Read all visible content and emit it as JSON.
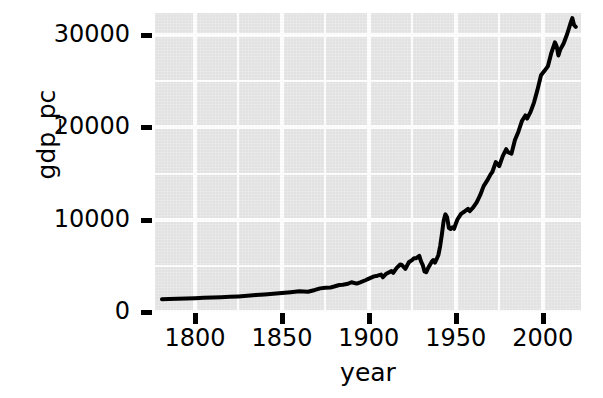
{
  "chart_data": {
    "type": "line",
    "title": "",
    "subtitle": "",
    "xlabel": "year",
    "ylabel": "gdp_pc",
    "xlim": [
      1777,
      2022
    ],
    "ylim": [
      0,
      32400
    ],
    "grid": true,
    "legend": null,
    "x_ticks": [
      1800,
      1850,
      1900,
      1950,
      2000
    ],
    "x_tick_labels": [
      "1800",
      "1850",
      "1900",
      "1950",
      "2000"
    ],
    "x_minor_ticks": [
      1775,
      1825,
      1875,
      1925,
      1975,
      2025
    ],
    "y_ticks": [
      0,
      10000,
      20000,
      30000
    ],
    "y_tick_labels": [
      "0",
      "10000",
      "20000",
      "30000"
    ],
    "y_minor_ticks": [
      5000,
      15000,
      25000
    ],
    "series": [
      {
        "name": "gdp_pc",
        "color": "#000000",
        "line_width": 4,
        "x": [
          1781,
          1785,
          1790,
          1795,
          1800,
          1805,
          1810,
          1815,
          1820,
          1825,
          1830,
          1835,
          1840,
          1845,
          1850,
          1855,
          1860,
          1865,
          1869,
          1872,
          1875,
          1878,
          1880,
          1883,
          1885,
          1888,
          1890,
          1893,
          1895,
          1898,
          1900,
          1903,
          1905,
          1907,
          1908,
          1910,
          1913,
          1914,
          1916,
          1918,
          1919,
          1920,
          1921,
          1923,
          1925,
          1926,
          1927,
          1929,
          1930,
          1931,
          1932,
          1933,
          1934,
          1936,
          1937,
          1938,
          1939,
          1940,
          1941,
          1942,
          1943,
          1944,
          1945,
          1946,
          1947,
          1948,
          1949,
          1950,
          1951,
          1953,
          1955,
          1957,
          1958,
          1960,
          1962,
          1964,
          1966,
          1968,
          1970,
          1971,
          1973,
          1974,
          1975,
          1977,
          1979,
          1980,
          1982,
          1984,
          1986,
          1988,
          1990,
          1991,
          1993,
          1995,
          1997,
          1999,
          2001,
          2003,
          2005,
          2007,
          2008,
          2009,
          2010,
          2012,
          2014,
          2016,
          2017,
          2018,
          2019
        ],
        "y": [
          1380,
          1400,
          1430,
          1460,
          1500,
          1540,
          1580,
          1600,
          1640,
          1690,
          1760,
          1830,
          1900,
          1970,
          2060,
          2150,
          2260,
          2200,
          2390,
          2560,
          2620,
          2660,
          2760,
          2930,
          2960,
          3060,
          3220,
          3080,
          3210,
          3440,
          3620,
          3860,
          3930,
          4060,
          3760,
          4150,
          4430,
          4250,
          4780,
          5140,
          5100,
          4880,
          4680,
          5390,
          5640,
          5830,
          5820,
          6070,
          5490,
          5090,
          4400,
          4310,
          4740,
          5400,
          5620,
          5350,
          5750,
          6180,
          7150,
          8420,
          9890,
          10580,
          10270,
          9120,
          8990,
          9170,
          9020,
          9560,
          10050,
          10640,
          10890,
          11180,
          10930,
          11330,
          11880,
          12660,
          13640,
          14230,
          14910,
          15170,
          16250,
          16020,
          15820,
          16900,
          17640,
          17320,
          17150,
          18630,
          19540,
          20690,
          21300,
          20960,
          21680,
          22720,
          24100,
          25650,
          26130,
          26650,
          28110,
          29220,
          28800,
          27800,
          28400,
          29100,
          30100,
          31300,
          31850,
          31100,
          30900
        ],
        "annotations": [
          {
            "label": "Great Depression trough",
            "x": 1933,
            "y": 4310
          },
          {
            "label": "WWII peak",
            "x": 1944,
            "y": 10580
          },
          {
            "label": "series maximum",
            "x": 2017,
            "y": 31850
          }
        ]
      }
    ],
    "theme": {
      "panel_background": "#e6e6e6",
      "gridline_color": "#ffffff",
      "text_color": "#000000",
      "plot_background": "#ffffff"
    }
  },
  "axes": {
    "x_title": "year",
    "y_title": "gdp_pc"
  }
}
